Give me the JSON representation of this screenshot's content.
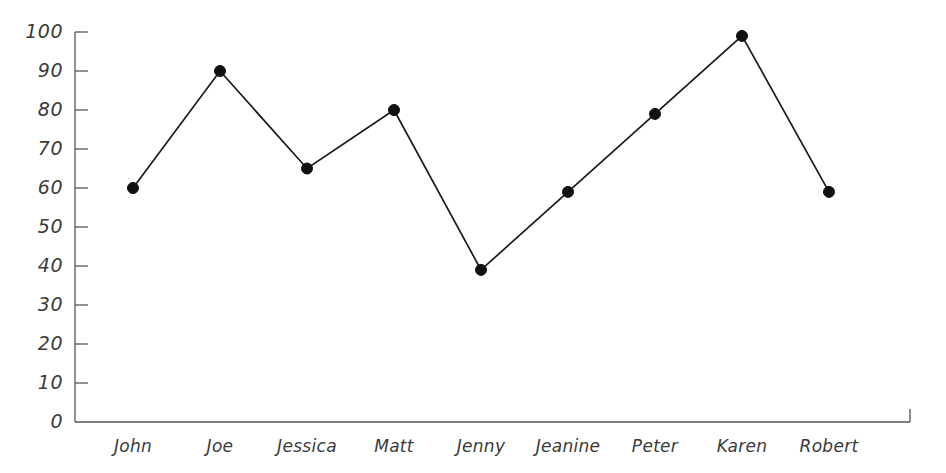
{
  "chart_data": {
    "type": "line",
    "title": "",
    "subtitle": "",
    "xlabel": "",
    "ylabel": "",
    "categories": [
      "John",
      "Joe",
      "Jessica",
      "Matt",
      "Jenny",
      "Jeanine",
      "Peter",
      "Karen",
      "Robert"
    ],
    "values": [
      60,
      90,
      65,
      80,
      39,
      59,
      79,
      99,
      59
    ],
    "series": [
      {
        "name": "",
        "values": [
          60,
          90,
          65,
          80,
          39,
          59,
          79,
          99,
          59
        ]
      }
    ],
    "ylim": [
      0,
      100
    ],
    "yticks": [
      0,
      10,
      20,
      30,
      40,
      50,
      60,
      70,
      80,
      90,
      100
    ],
    "ytick_labels": [
      "0",
      "10",
      "20",
      "30",
      "40",
      "50",
      "60",
      "70",
      "80",
      "90",
      "100"
    ],
    "xtick_labels": [
      "John",
      "Joe",
      "Jessica",
      "Matt",
      "Jenny",
      "Jeanine",
      "Peter",
      "Karen",
      "Robert"
    ],
    "grid": false,
    "legend": false,
    "legend_position": "none",
    "marker": "filled-circle",
    "line_color": "#1a1a1a",
    "marker_color": "#111111",
    "axis_color": "#555555",
    "background_color": "#ffffff",
    "text_color": "#3a3a3a"
  },
  "style": {
    "marker_radius": 5.5,
    "line_width": 1.7,
    "axis_width": 1.3,
    "tick_length": 13
  },
  "geometry": {
    "plot_left": 75,
    "plot_right": 910,
    "plot_top": 32,
    "plot_bottom": 422,
    "first_x": 133,
    "x_step": 87
  }
}
